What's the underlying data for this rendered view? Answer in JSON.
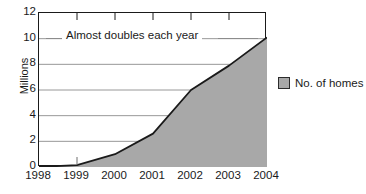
{
  "chart_data": {
    "type": "area",
    "title": "",
    "xlabel": "",
    "ylabel": "Millions",
    "categories": [
      "1998",
      "1999",
      "2000",
      "2001",
      "2002",
      "2003",
      "2004"
    ],
    "values": [
      0,
      0.15,
      1.0,
      2.6,
      6.0,
      7.9,
      10.1
    ],
    "series": [
      {
        "name": "No. of homes",
        "values": [
          0,
          0.15,
          1.0,
          2.6,
          6.0,
          7.9,
          10.1
        ]
      }
    ],
    "ylim": [
      0,
      12
    ],
    "y_ticks": [
      "0",
      "2",
      "4",
      "6",
      "8",
      "10",
      "12"
    ],
    "y_tick_values": [
      0,
      2,
      4,
      6,
      8,
      10,
      12
    ],
    "grid": "horizontal",
    "gridlines_at": [
      2,
      4,
      6,
      8,
      10
    ],
    "legend_position": "right",
    "legend": [
      "No. of homes"
    ],
    "annotations": [
      {
        "text": "Almost doubles each year",
        "at_y": 10,
        "style": "leader-line-both-sides"
      }
    ],
    "colors": {
      "area_fill": "#a8a8a8",
      "area_line": "#1a1a1a",
      "axis": "#1a1a1a",
      "gridline": "#8c8c8c",
      "background": "#ffffff",
      "text": "#1a1a1a"
    }
  },
  "legend": {
    "label": "No. of homes"
  },
  "axes": {
    "y_title": "Millions"
  }
}
